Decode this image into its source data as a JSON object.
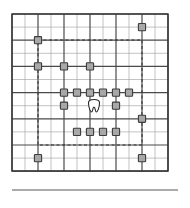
{
  "figure": {
    "title": "",
    "caption": ""
  },
  "colors": {
    "background": "#ffffff",
    "grid_major": "#4a4a4a",
    "grid_minor": "#9a9a9a",
    "frame": "#333333",
    "marker_fill": "#a8a8a8",
    "marker_stroke": "#3c3c3c",
    "dashed_boundary": "#2e2e2e",
    "rule": "#8f8f8f",
    "center_symbol_fill": "#ffffff",
    "center_symbol_stroke": "#2a2a2a"
  },
  "grid": {
    "type": "square-lattice",
    "columns": 12,
    "rows": 12,
    "origin_x": 12,
    "origin_y": 14,
    "cell_width": 13.0,
    "cell_height": 13.1,
    "major_line_width": 1.2,
    "minor_line_width": 0.6,
    "major_columns": [
      0,
      2,
      4,
      6,
      8,
      10,
      12
    ],
    "major_rows": [
      0,
      2,
      4,
      6,
      8,
      10,
      12
    ]
  },
  "frame": {
    "x": 12,
    "y": 14,
    "width": 156,
    "height": 157,
    "stroke_width": 1.4
  },
  "dashed_boundary": {
    "x": 38,
    "y": 40,
    "width": 104,
    "height": 105,
    "dash": "3 2.5",
    "stroke_width": 1.0
  },
  "center_symbol": {
    "name": "tooth-symbol",
    "cx": 94,
    "cy": 106,
    "width": 11,
    "height": 12
  },
  "markers": {
    "size": 7.2,
    "corner_radius": 0.8,
    "note": "grid coordinates in cell units measured from frame origin",
    "outer": [
      {
        "col": 2,
        "row": 2
      },
      {
        "col": 10,
        "row": 1
      },
      {
        "col": 2,
        "row": 4
      },
      {
        "col": 10,
        "row": 8
      },
      {
        "col": 2,
        "row": 11
      },
      {
        "col": 10,
        "row": 11
      }
    ],
    "inner_ring": [
      {
        "col": 4,
        "row": 4
      },
      {
        "col": 4,
        "row": 6
      },
      {
        "col": 4,
        "row": 7
      },
      {
        "col": 5,
        "row": 6
      },
      {
        "col": 5,
        "row": 9
      },
      {
        "col": 6,
        "row": 4
      },
      {
        "col": 6,
        "row": 6
      },
      {
        "col": 6,
        "row": 9
      },
      {
        "col": 7,
        "row": 6
      },
      {
        "col": 7,
        "row": 9
      },
      {
        "col": 8,
        "row": 6
      },
      {
        "col": 8,
        "row": 7
      },
      {
        "col": 8,
        "row": 9
      },
      {
        "col": 9,
        "row": 6
      }
    ]
  },
  "bottom_rule": {
    "x1": 12,
    "x2": 178,
    "y": 190,
    "stroke_width": 1.6
  }
}
